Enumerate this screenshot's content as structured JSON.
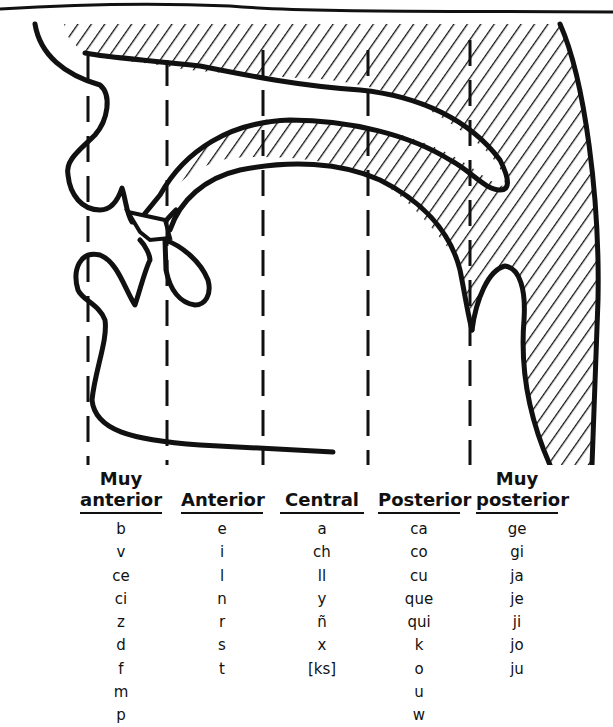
{
  "diagram": {
    "colors": {
      "ink": "#111111",
      "paper": "#ffffff"
    },
    "guide_lines_x": [
      88,
      167,
      263,
      368,
      470
    ]
  },
  "table": {
    "columns": [
      {
        "header_line1": "Muy",
        "header_line2": "anterior",
        "items": [
          "b",
          "v",
          "ce",
          "ci",
          "z",
          "d",
          "f",
          "m",
          "p"
        ]
      },
      {
        "header_line1": "",
        "header_line2": "Anterior",
        "items": [
          "e",
          "i",
          "l",
          "n",
          "r",
          "s",
          "t"
        ]
      },
      {
        "header_line1": "",
        "header_line2": "Central",
        "items": [
          "a",
          "ch",
          "ll",
          "y",
          "ñ",
          "x",
          "[ks]"
        ]
      },
      {
        "header_line1": "",
        "header_line2": "Posterior",
        "items": [
          "ca",
          "co",
          "cu",
          "que",
          "qui",
          "k",
          "o",
          "u",
          "w"
        ]
      },
      {
        "header_line1": "Muy",
        "header_line2": "posterior",
        "items": [
          "ge",
          "gi",
          "ja",
          "je",
          "ji",
          "jo",
          "ju"
        ]
      }
    ]
  }
}
